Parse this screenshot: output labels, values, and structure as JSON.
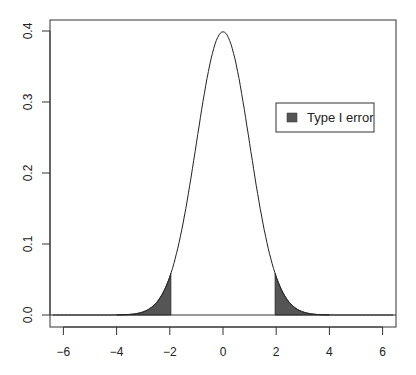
{
  "chart_data": {
    "type": "area",
    "title": "",
    "xlabel": "",
    "ylabel": "",
    "xlim": [
      -6.5,
      6.5
    ],
    "ylim": [
      -0.02,
      0.42
    ],
    "x_ticks": [
      "-6",
      "-4",
      "-2",
      "0",
      "2",
      "4",
      "6"
    ],
    "y_ticks": [
      "0.0",
      "0.1",
      "0.2",
      "0.3",
      "0.4"
    ],
    "grid": false,
    "series": [
      {
        "name": "Standard normal density",
        "type": "line",
        "function": "dnorm(x, 0, 1)",
        "peak": {
          "x": 0,
          "y": 0.399
        }
      },
      {
        "name": "Type I error",
        "type": "shaded_area",
        "regions": [
          [
            -4,
            -1.96
          ],
          [
            1.96,
            4
          ]
        ],
        "color": "#555555"
      }
    ],
    "reference_lines": [
      {
        "orientation": "horizontal",
        "y": 0
      }
    ],
    "legend": {
      "position": "right-middle",
      "entries": [
        {
          "label": "Type I error",
          "color": "#555555"
        }
      ]
    }
  }
}
